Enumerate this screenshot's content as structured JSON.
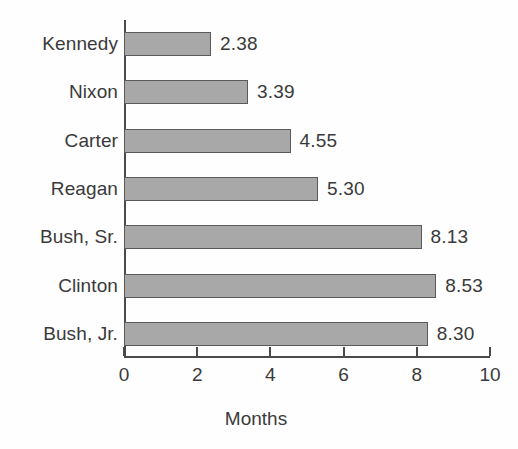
{
  "chart_data": {
    "type": "bar",
    "orientation": "horizontal",
    "title": "",
    "xlabel": "Months",
    "ylabel": "",
    "xlim": [
      0,
      10
    ],
    "xticks": [
      0,
      2,
      4,
      6,
      8,
      10
    ],
    "xtick_labels": [
      "0",
      "2",
      "4",
      "6",
      "8",
      "10"
    ],
    "grid": false,
    "legend": false,
    "bar_color": "#a8a8a8",
    "bar_border_color": "#5a5a5a",
    "text_color": "#3a3a3a",
    "background": "#ffffff",
    "categories": [
      "Kennedy",
      "Nixon",
      "Carter",
      "Reagan",
      "Bush, Sr.",
      "Clinton",
      "Bush, Jr."
    ],
    "values": [
      2.38,
      3.39,
      4.55,
      5.3,
      8.13,
      8.53,
      8.3
    ],
    "value_labels": [
      "2.38",
      "3.39",
      "4.55",
      "5.30",
      "8.13",
      "8.53",
      "8.30"
    ],
    "bars": [
      {
        "category": "Kennedy",
        "value": 2.38,
        "label": "2.38"
      },
      {
        "category": "Nixon",
        "value": 3.39,
        "label": "3.39"
      },
      {
        "category": "Carter",
        "value": 4.55,
        "label": "4.55"
      },
      {
        "category": "Reagan",
        "value": 5.3,
        "label": "5.30"
      },
      {
        "category": "Bush, Sr.",
        "value": 8.13,
        "label": "8.13"
      },
      {
        "category": "Clinton",
        "value": 8.53,
        "label": "8.53"
      },
      {
        "category": "Bush, Jr.",
        "value": 8.3,
        "label": "8.30"
      }
    ]
  }
}
